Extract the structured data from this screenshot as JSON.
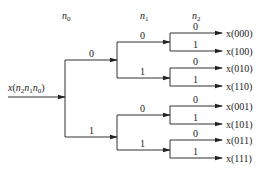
{
  "diagram": {
    "type": "binary tree (bit-reversal / FFT decimation-in-time index ordering)",
    "input_label": "x(n2n1n0)",
    "input": {
      "base": "x(",
      "n2": "n",
      "s2": "2",
      "n1": "n",
      "s1": "1",
      "n0": "n",
      "s0": "0",
      "close": ")"
    },
    "stage_headers": [
      {
        "var": "n",
        "sub": "0"
      },
      {
        "var": "n",
        "sub": "1"
      },
      {
        "var": "n",
        "sub": "2"
      }
    ],
    "level1_labels": [
      "0",
      "1"
    ],
    "level2_labels": [
      "0",
      "1",
      "0",
      "1"
    ],
    "level3_labels": [
      "0",
      "1",
      "0",
      "1",
      "0",
      "1",
      "0",
      "1"
    ],
    "outputs": [
      "x(000)",
      "x(100)",
      "x(010)",
      "x(110)",
      "x(001)",
      "x(101)",
      "x(011)",
      "x(111)"
    ],
    "line_color": "#333333"
  }
}
